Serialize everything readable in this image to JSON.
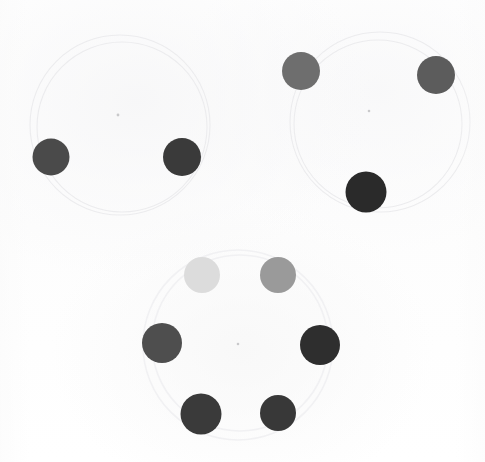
{
  "scene": {
    "title": "Grayscale dot cluster pattern",
    "background_color": "#ffffff",
    "width": 485,
    "height": 462,
    "medium": "scanned paper with pencil guide circles"
  },
  "chart_data": {
    "type": "scatter",
    "subtitle": "Three radial clusters of filled circles on pencil guide rings",
    "xlabel": "",
    "ylabel": "",
    "xlim": [
      0,
      485
    ],
    "ylim": [
      0,
      462
    ],
    "grid": false,
    "legend": "none",
    "units": "pixels",
    "value_encoding": "gray_level (0 = black, 255 = white)",
    "clusters": [
      {
        "name": "upper-left-cluster",
        "ring_center": [
          120,
          125
        ],
        "ring_radius": 90,
        "dot_count": 2
      },
      {
        "name": "upper-right-cluster",
        "ring_center": [
          380,
          122
        ],
        "ring_radius": 90,
        "dot_count": 3
      },
      {
        "name": "lower-center-cluster",
        "ring_center": [
          238,
          345
        ],
        "ring_radius": 95,
        "dot_count": 6
      }
    ],
    "points": [
      {
        "id": "dot-1",
        "cluster": "upper-left-cluster",
        "x": 51,
        "y": 157,
        "d": 37,
        "color": "#4a4a4a",
        "gray": 74
      },
      {
        "id": "dot-2",
        "cluster": "upper-left-cluster",
        "x": 182,
        "y": 157,
        "d": 38,
        "color": "#3a3a3a",
        "gray": 58
      },
      {
        "id": "dot-3",
        "cluster": "upper-right-cluster",
        "x": 301,
        "y": 71,
        "d": 38,
        "color": "#6e6e6e",
        "gray": 110
      },
      {
        "id": "dot-4",
        "cluster": "upper-right-cluster",
        "x": 436,
        "y": 75,
        "d": 38,
        "color": "#5c5c5c",
        "gray": 92
      },
      {
        "id": "dot-5",
        "cluster": "upper-right-cluster",
        "x": 366,
        "y": 192,
        "d": 41,
        "color": "#2a2a2a",
        "gray": 42
      },
      {
        "id": "dot-6",
        "cluster": "lower-center-cluster",
        "x": 202,
        "y": 275,
        "d": 36,
        "color": "#dcdcdc",
        "gray": 220
      },
      {
        "id": "dot-7",
        "cluster": "lower-center-cluster",
        "x": 278,
        "y": 275,
        "d": 36,
        "color": "#9a9a9a",
        "gray": 154
      },
      {
        "id": "dot-8",
        "cluster": "lower-center-cluster",
        "x": 162,
        "y": 343,
        "d": 40,
        "color": "#4e4e4e",
        "gray": 78
      },
      {
        "id": "dot-9",
        "cluster": "lower-center-cluster",
        "x": 320,
        "y": 345,
        "d": 40,
        "color": "#2e2e2e",
        "gray": 46
      },
      {
        "id": "dot-10",
        "cluster": "lower-center-cluster",
        "x": 201,
        "y": 414,
        "d": 41,
        "color": "#3a3a3a",
        "gray": 58
      },
      {
        "id": "dot-11",
        "cluster": "lower-center-cluster",
        "x": 278,
        "y": 413,
        "d": 36,
        "color": "#383838",
        "gray": 56
      }
    ],
    "guide_rings": [
      {
        "id": "ring-upper-left",
        "cx": 120,
        "cy": 125,
        "r": 90,
        "color": "#ececee"
      },
      {
        "id": "ring-upper-right",
        "cx": 380,
        "cy": 122,
        "r": 90,
        "color": "#ececee"
      },
      {
        "id": "ring-lower-center",
        "cx": 238,
        "cy": 345,
        "r": 95,
        "color": "#f1f1f3"
      }
    ],
    "center_marks": [
      {
        "id": "mark-upper-left",
        "x": 118,
        "y": 115
      },
      {
        "id": "mark-upper-right",
        "x": 369,
        "y": 111
      },
      {
        "id": "mark-lower-center",
        "x": 238,
        "y": 344
      }
    ]
  }
}
